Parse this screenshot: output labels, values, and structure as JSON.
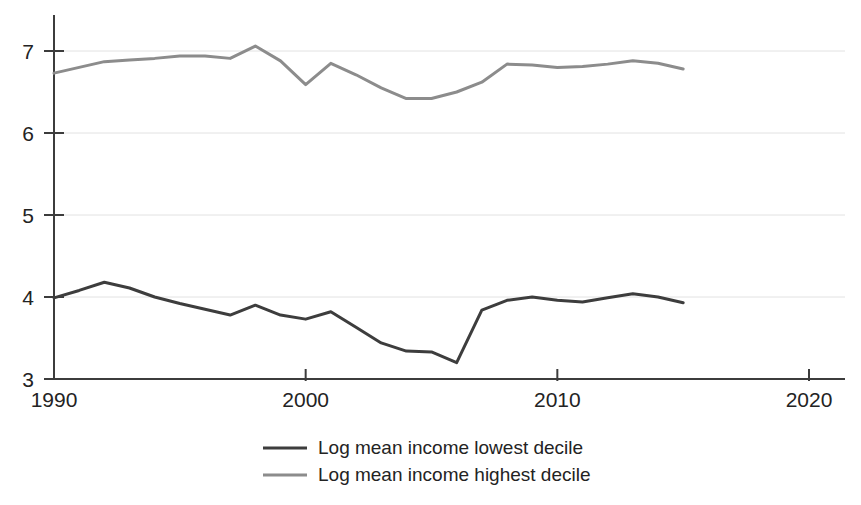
{
  "chart_data": {
    "type": "line",
    "title": "",
    "subtitle": "",
    "xlabel": "",
    "ylabel": "",
    "xlim": [
      1990,
      2020
    ],
    "ylim": [
      3,
      7.5
    ],
    "xticks": [
      1990,
      2000,
      2010,
      2020
    ],
    "xtick_labels": [
      "1990",
      "2000",
      "2010",
      "2020"
    ],
    "yticks": [
      3,
      4,
      5,
      6,
      7
    ],
    "ytick_labels": [
      "3",
      "4",
      "5",
      "6",
      "7"
    ],
    "grid": "horizontal",
    "grid_color": "#e2e2e2",
    "axis_color": "#3c3c3c",
    "background": "#ffffff",
    "legend_position": "bottom-center",
    "x": [
      1990,
      1991,
      1992,
      1993,
      1994,
      1995,
      1996,
      1997,
      1998,
      1999,
      2000,
      2001,
      2002,
      2003,
      2004,
      2005,
      2006,
      2007,
      2008,
      2009,
      2010,
      2011,
      2012,
      2013,
      2014,
      2015
    ],
    "series": [
      {
        "name": "Log mean income lowest decile",
        "color": "#3d3d3d",
        "width": 3.0,
        "values": [
          3.99,
          4.08,
          4.18,
          4.11,
          4.0,
          3.92,
          3.85,
          3.78,
          3.9,
          3.78,
          3.73,
          3.82,
          3.63,
          3.44,
          3.34,
          3.33,
          3.2,
          3.84,
          3.96,
          4.0,
          3.96,
          3.94,
          3.99,
          4.04,
          4.0,
          3.93
        ]
      },
      {
        "name": "Log mean income highest decile",
        "color": "#8c8c8c",
        "width": 3.0,
        "values": [
          6.73,
          6.8,
          6.87,
          6.89,
          6.91,
          6.94,
          6.94,
          6.91,
          7.06,
          6.88,
          6.59,
          6.85,
          6.71,
          6.55,
          6.42,
          6.42,
          6.5,
          6.62,
          6.84,
          6.83,
          6.8,
          6.81,
          6.84,
          6.88,
          6.85,
          6.78
        ]
      }
    ],
    "legend": [
      {
        "label": "Log mean income lowest decile",
        "color": "#3d3d3d"
      },
      {
        "label": "Log mean income highest decile",
        "color": "#8c8c8c"
      }
    ]
  }
}
